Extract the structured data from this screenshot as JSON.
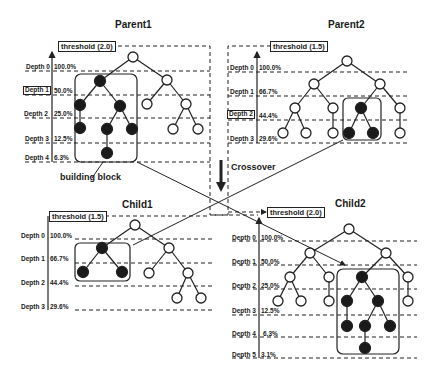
{
  "diagram": {
    "crossover_label": "Crossover",
    "building_block_label": "building block",
    "colors": {
      "line": "#222222",
      "filled_node": "#1a1a1a",
      "empty_node": "#ffffff"
    }
  },
  "parent1": {
    "title": "Parent1",
    "threshold": "threshold (2.0)",
    "depths": [
      {
        "label": "Depth 0",
        "pct": "100.0%"
      },
      {
        "label": "Depth 1",
        "pct": "50.0%",
        "highlighted": true
      },
      {
        "label": "Depth 2",
        "pct": "25.0%"
      },
      {
        "label": "Depth 3",
        "pct": "12.5%"
      },
      {
        "label": "Depth 4",
        "pct": "6.3%"
      }
    ]
  },
  "parent2": {
    "title": "Parent2",
    "threshold": "threshold (1.5)",
    "depths": [
      {
        "label": "Depth 0",
        "pct": "100.0%"
      },
      {
        "label": "Depth 1",
        "pct": "66.7%"
      },
      {
        "label": "Depth 2",
        "pct": "44.4%",
        "highlighted": true
      },
      {
        "label": "Depth 3",
        "pct": "29.6%"
      }
    ]
  },
  "child1": {
    "title": "Child1",
    "threshold": "threshold (1.5)",
    "depths": [
      {
        "label": "Depth 0",
        "pct": "100.0%"
      },
      {
        "label": "Depth 1",
        "pct": "66.7%"
      },
      {
        "label": "Depth 2",
        "pct": "44.4%"
      },
      {
        "label": "Depth 3",
        "pct": "29.6%"
      }
    ]
  },
  "child2": {
    "title": "Child2",
    "threshold": "threshold (2.0)",
    "depths": [
      {
        "label": "Depth 0",
        "pct": "100.0%"
      },
      {
        "label": "Depth 1",
        "pct": "50.0%"
      },
      {
        "label": "Depth 2",
        "pct": "25.0%"
      },
      {
        "label": "Depth 3",
        "pct": "12.5%"
      },
      {
        "label": "Depth 4",
        "pct": "6.3%"
      },
      {
        "label": "Depth 5",
        "pct": "3.1%"
      }
    ]
  }
}
